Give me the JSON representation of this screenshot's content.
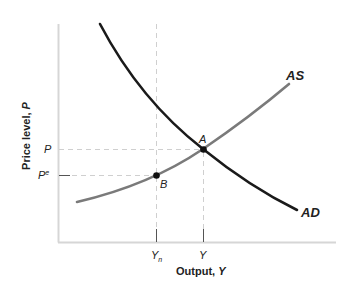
{
  "diagram": {
    "type": "AS-AD model",
    "axes": {
      "y_label": "Price level, P",
      "y_label_prefix": "Price level, ",
      "y_label_var": "P",
      "x_label": "Output, Y",
      "x_label_prefix": "Output, ",
      "x_label_var": "Y"
    },
    "y_ticks": [
      {
        "label": "P",
        "superscript": ""
      },
      {
        "label": "P",
        "superscript": "e"
      }
    ],
    "x_ticks": [
      {
        "label": "Y",
        "subscript": "n"
      },
      {
        "label": "Y",
        "subscript": ""
      }
    ],
    "curves": [
      {
        "name": "AS",
        "color": "#7a7a7a",
        "shape": "upward-sloping convex"
      },
      {
        "name": "AD",
        "color": "#1a1a1a",
        "shape": "downward-sloping convex"
      }
    ],
    "points": [
      {
        "label": "A",
        "description": "intersection of AS and AD at (Y, P)"
      },
      {
        "label": "B",
        "description": "point on AS at (Yn, Pe)"
      }
    ],
    "colors": {
      "axis": "#d6d6d6",
      "guide_dashed": "#cfcfcf",
      "as_curve": "#7a7a7a",
      "ad_curve": "#1a1a1a",
      "point": "#111111",
      "text": "#222222"
    }
  }
}
